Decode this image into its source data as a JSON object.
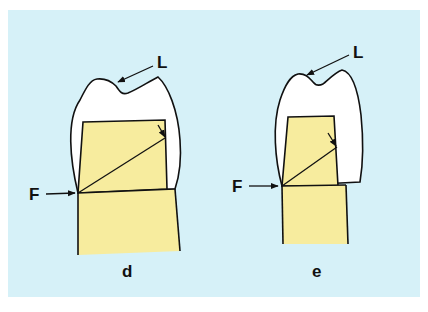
{
  "colors": {
    "page_background": "#ffffff",
    "panel_background": "#d6f1f8",
    "enamel_white": "#ffffff",
    "dentin_yellow": "#f7ec9e",
    "outline": "#111111"
  },
  "figure": {
    "panels": [
      {
        "id": "d",
        "caption": "d",
        "labels": {
          "top": "L",
          "side": "F"
        }
      },
      {
        "id": "e",
        "caption": "e",
        "labels": {
          "top": "L",
          "side": "F"
        }
      }
    ]
  }
}
